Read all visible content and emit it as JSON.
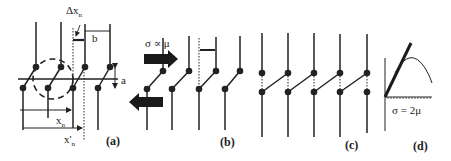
{
  "figure": {
    "panels": [
      {
        "id": "a",
        "label": "(a)"
      },
      {
        "id": "b",
        "label": "(b)"
      },
      {
        "id": "c",
        "label": "(c)"
      },
      {
        "id": "d",
        "label": "(d)"
      }
    ],
    "annotations": {
      "delta_x": "Δx",
      "delta_x_sub": "n",
      "b": "b",
      "a": "a",
      "x_n": "x",
      "x_n_sub": "n",
      "x_prime_n": "x'",
      "x_prime_n_sub": "n",
      "sigma_prop_mu": "σ ∝ μ",
      "sigma_eq_2mu": "σ = 2μ"
    },
    "colors": {
      "ink": "#222222",
      "arrow": "#1a1a1a",
      "background": "#ffffff"
    }
  }
}
